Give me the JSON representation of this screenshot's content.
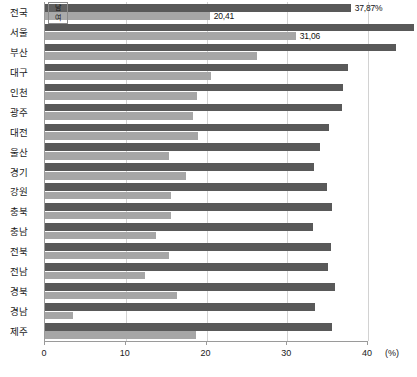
{
  "chart_data": {
    "type": "bar",
    "orientation": "horizontal",
    "title": "",
    "xlabel": "(%)",
    "ylabel": "",
    "xlim": [
      0,
      43
    ],
    "xticks": [
      0,
      10,
      20,
      30,
      40
    ],
    "xtick_labels": [
      "0",
      "10",
      "20",
      "30",
      "40"
    ],
    "unit": "(%)",
    "grid": true,
    "grid_axis": "x",
    "legend_position": "top-left-inside",
    "categories": [
      "전국",
      "서울",
      "부산",
      "대구",
      "인천",
      "광주",
      "대전",
      "울산",
      "경기",
      "강원",
      "충북",
      "충남",
      "전북",
      "전남",
      "경북",
      "경남",
      "제주"
    ],
    "series": [
      {
        "name": "남",
        "color": "#595959",
        "values": [
          37.87,
          45.72,
          43.5,
          37.5,
          36.9,
          36.8,
          35.2,
          34.0,
          33.3,
          34.9,
          35.6,
          33.2,
          35.4,
          35.0,
          35.9,
          33.4,
          35.5
        ]
      },
      {
        "name": "여",
        "color": "#a6a6a6",
        "values": [
          20.41,
          31.06,
          26.3,
          20.5,
          18.8,
          18.3,
          19.0,
          15.3,
          17.4,
          15.6,
          15.6,
          13.7,
          15.3,
          12.4,
          16.3,
          3.5,
          18.7
        ]
      }
    ],
    "data_labels": [
      {
        "category": "전국",
        "series": "남",
        "text": "37,87%",
        "placement": "outside"
      },
      {
        "category": "전국",
        "series": "여",
        "text": "20,41",
        "placement": "outside"
      },
      {
        "category": "서울",
        "series": "남",
        "text": "45,72",
        "placement": "outside"
      },
      {
        "category": "서울",
        "series": "여",
        "text": "31,06",
        "placement": "outside"
      }
    ]
  },
  "legend": {
    "items": [
      {
        "label": "남"
      },
      {
        "label": "여"
      }
    ]
  },
  "colors": {
    "male_bar": "#595959",
    "female_bar": "#a6a6a6",
    "gridline": "#d2d2d2",
    "axis": "#9a9a9a",
    "text": "#1a1a1a",
    "background": "#ffffff"
  }
}
